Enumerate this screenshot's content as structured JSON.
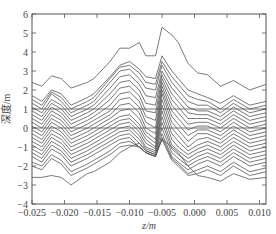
{
  "chart_data": {
    "type": "line",
    "title": "",
    "xlabel": "z/m",
    "ylabel": "深度/m",
    "xlim": [
      -0.025,
      0.011
    ],
    "ylim": [
      -4,
      6
    ],
    "xticks": [
      -0.025,
      -0.02,
      -0.015,
      -0.01,
      -0.005,
      0.0,
      0.005,
      0.01
    ],
    "xtick_labels": [
      "−0.025",
      "−0.020",
      "−0.015",
      "−0.010",
      "−0.005",
      "0.000",
      "0.005",
      "0.010"
    ],
    "yticks": [
      -4,
      -3,
      -2,
      -1,
      0,
      1,
      2,
      3,
      4,
      5,
      6
    ],
    "ytick_labels": [
      "−4",
      "−3",
      "−2",
      "−1",
      "0",
      "1",
      "2",
      "3",
      "4",
      "5",
      "6"
    ],
    "grid": false,
    "legend": null,
    "hlines": [
      1,
      0
    ],
    "line_color": "#555555",
    "x": [
      -0.025,
      -0.0235,
      -0.022,
      -0.0205,
      -0.019,
      -0.0165,
      -0.0155,
      -0.013,
      -0.0115,
      -0.01,
      -0.0085,
      -0.0075,
      -0.006,
      -0.005,
      -0.0035,
      -0.0025,
      -0.001,
      0.0005,
      0.002,
      0.004,
      0.006,
      0.0085,
      0.011
    ],
    "series": [
      {
        "name": "s1",
        "values": [
          2.4,
          2.2,
          2.75,
          2.6,
          2.1,
          2.4,
          2.6,
          3.5,
          4.2,
          4.2,
          4.5,
          3.8,
          3.8,
          5.3,
          4.9,
          4.5,
          3.4,
          2.9,
          2.8,
          2.2,
          2.5,
          2.0,
          2.3
        ]
      },
      {
        "name": "s2",
        "values": [
          1.7,
          1.4,
          2.0,
          1.8,
          1.2,
          1.6,
          1.8,
          2.7,
          3.3,
          3.5,
          3.1,
          2.7,
          2.6,
          3.8,
          3.0,
          2.6,
          2.0,
          1.8,
          1.6,
          1.3,
          1.7,
          1.2,
          1.4
        ]
      },
      {
        "name": "s3",
        "values": [
          1.5,
          1.2,
          1.9,
          1.6,
          1.0,
          1.4,
          1.6,
          2.6,
          3.2,
          3.3,
          2.9,
          2.4,
          2.3,
          3.5,
          2.7,
          2.3,
          1.7,
          1.5,
          1.4,
          1.0,
          1.5,
          1.0,
          1.2
        ]
      },
      {
        "name": "s4",
        "values": [
          1.3,
          1.0,
          1.8,
          1.4,
          0.8,
          1.2,
          1.4,
          2.4,
          3.0,
          3.1,
          2.6,
          2.1,
          2.0,
          3.3,
          2.4,
          2.0,
          1.4,
          1.2,
          1.2,
          0.8,
          1.3,
          0.8,
          1.0
        ]
      },
      {
        "name": "s5",
        "values": [
          1.1,
          0.8,
          1.5,
          1.2,
          0.6,
          1.0,
          1.2,
          2.1,
          2.7,
          2.8,
          2.3,
          1.7,
          1.6,
          3.0,
          2.1,
          1.7,
          1.1,
          0.9,
          0.9,
          0.6,
          1.1,
          0.6,
          0.8
        ]
      },
      {
        "name": "s6",
        "values": [
          0.9,
          0.6,
          1.3,
          1.0,
          0.4,
          0.8,
          1.0,
          1.8,
          2.4,
          2.5,
          2.0,
          1.3,
          1.2,
          2.8,
          1.8,
          1.4,
          0.8,
          0.7,
          0.7,
          0.4,
          0.9,
          0.4,
          0.6
        ]
      },
      {
        "name": "s7",
        "values": [
          0.7,
          0.4,
          1.1,
          0.8,
          0.2,
          0.6,
          0.8,
          1.5,
          2.1,
          2.2,
          1.7,
          0.9,
          0.8,
          2.6,
          1.5,
          1.1,
          0.5,
          0.5,
          0.5,
          0.2,
          0.7,
          0.2,
          0.4
        ]
      },
      {
        "name": "s8",
        "values": [
          0.5,
          0.2,
          0.9,
          0.6,
          0.0,
          0.4,
          0.6,
          1.2,
          1.8,
          1.9,
          1.4,
          0.6,
          0.4,
          2.4,
          1.2,
          0.8,
          0.2,
          0.3,
          0.3,
          0.0,
          0.5,
          0.0,
          0.2
        ]
      },
      {
        "name": "s9",
        "values": [
          0.3,
          0.0,
          0.7,
          0.4,
          -0.2,
          0.2,
          0.4,
          0.9,
          1.5,
          1.6,
          1.1,
          0.3,
          0.0,
          2.2,
          0.9,
          0.5,
          -0.1,
          0.1,
          0.1,
          -0.2,
          0.3,
          -0.2,
          0.0
        ]
      },
      {
        "name": "s10",
        "values": [
          0.1,
          -0.2,
          0.5,
          0.2,
          -0.4,
          0.0,
          0.2,
          0.7,
          1.2,
          1.3,
          0.8,
          0.0,
          -0.3,
          2.0,
          0.6,
          0.2,
          -0.4,
          -0.1,
          -0.1,
          -0.4,
          0.1,
          -0.4,
          -0.2
        ]
      },
      {
        "name": "s11",
        "values": [
          -0.1,
          -0.4,
          0.3,
          0.0,
          -0.6,
          -0.2,
          0.0,
          0.5,
          0.9,
          1.0,
          0.5,
          -0.2,
          -0.6,
          1.8,
          0.3,
          -0.1,
          -0.7,
          -0.3,
          -0.3,
          -0.6,
          -0.1,
          -0.6,
          -0.4
        ]
      },
      {
        "name": "s12",
        "values": [
          -0.3,
          -0.6,
          0.1,
          -0.2,
          -0.8,
          -0.4,
          -0.2,
          0.3,
          0.6,
          0.7,
          0.2,
          -0.4,
          -0.8,
          1.5,
          0.0,
          -0.4,
          -1.0,
          -0.6,
          -0.5,
          -0.8,
          -0.3,
          -0.8,
          -0.6
        ]
      },
      {
        "name": "s13",
        "values": [
          -0.5,
          -0.8,
          -0.1,
          -0.4,
          -1.0,
          -0.6,
          -0.4,
          0.1,
          0.4,
          0.5,
          0.0,
          -0.6,
          -1.0,
          1.2,
          -0.3,
          -0.7,
          -1.2,
          -0.9,
          -0.7,
          -1.0,
          -0.5,
          -1.0,
          -0.8
        ]
      },
      {
        "name": "s14",
        "values": [
          -0.7,
          -1.0,
          -0.3,
          -0.6,
          -1.2,
          -0.8,
          -0.6,
          -0.1,
          0.2,
          0.3,
          -0.2,
          -0.8,
          -1.1,
          0.9,
          -0.6,
          -1.0,
          -1.4,
          -1.1,
          -0.9,
          -1.2,
          -0.7,
          -1.2,
          -1.0
        ]
      },
      {
        "name": "s15",
        "values": [
          -0.9,
          -1.2,
          -0.5,
          -0.8,
          -1.4,
          -1.0,
          -0.8,
          -0.3,
          0.0,
          0.1,
          -0.4,
          -1.0,
          -1.2,
          0.6,
          -0.9,
          -1.2,
          -1.6,
          -1.3,
          -1.1,
          -1.4,
          -0.9,
          -1.4,
          -1.2
        ]
      },
      {
        "name": "s16",
        "values": [
          -1.1,
          -1.4,
          -0.7,
          -1.0,
          -1.6,
          -1.2,
          -1.0,
          -0.5,
          -0.2,
          -0.1,
          -0.6,
          -1.1,
          -1.3,
          0.3,
          -1.1,
          -1.4,
          -1.8,
          -1.5,
          -1.3,
          -1.6,
          -1.1,
          -1.6,
          -1.4
        ]
      },
      {
        "name": "s17",
        "values": [
          -1.3,
          -1.6,
          -0.9,
          -1.2,
          -1.8,
          -1.4,
          -1.2,
          -0.7,
          -0.4,
          -0.3,
          -0.8,
          -1.2,
          -1.4,
          0.0,
          -1.3,
          -1.6,
          -2.0,
          -1.7,
          -1.5,
          -1.8,
          -1.3,
          -1.8,
          -1.6
        ]
      },
      {
        "name": "s18",
        "values": [
          -1.5,
          -1.8,
          -1.1,
          -1.4,
          -2.0,
          -1.6,
          -1.4,
          -0.9,
          -0.6,
          -0.5,
          -1.0,
          -1.3,
          -1.5,
          -0.3,
          -1.5,
          -1.8,
          -2.2,
          -1.9,
          -1.7,
          -2.0,
          -1.5,
          -2.0,
          -1.8
        ]
      },
      {
        "name": "s19",
        "values": [
          -1.8,
          -2.0,
          -1.4,
          -1.7,
          -2.3,
          -1.9,
          -1.7,
          -1.2,
          -0.8,
          -0.7,
          -1.0,
          -1.3,
          -1.5,
          -0.5,
          -1.6,
          -1.9,
          -2.4,
          -2.2,
          -2.0,
          -2.3,
          -1.8,
          -2.3,
          -2.1
        ]
      },
      {
        "name": "s20",
        "values": [
          -2.0,
          -2.2,
          -1.6,
          -1.9,
          -2.5,
          -2.1,
          -1.9,
          -1.4,
          -1.0,
          -0.9,
          -1.0,
          -1.3,
          -1.5,
          -0.6,
          -1.7,
          -2.0,
          -2.5,
          -2.4,
          -2.2,
          -2.5,
          -2.0,
          -2.5,
          -2.3
        ]
      },
      {
        "name": "s21",
        "values": [
          -2.6,
          -2.6,
          -2.5,
          -2.6,
          -3.0,
          -2.4,
          -2.3,
          -1.8,
          -1.3,
          -1.0,
          -0.8,
          -1.2,
          -1.4,
          -0.6,
          -1.0,
          -1.3,
          -2.0,
          -2.5,
          -2.6,
          -2.8,
          -2.4,
          -2.7,
          -2.6
        ]
      }
    ]
  },
  "plot": {
    "left": 32,
    "top": 14,
    "right": 266,
    "bottom": 204
  }
}
